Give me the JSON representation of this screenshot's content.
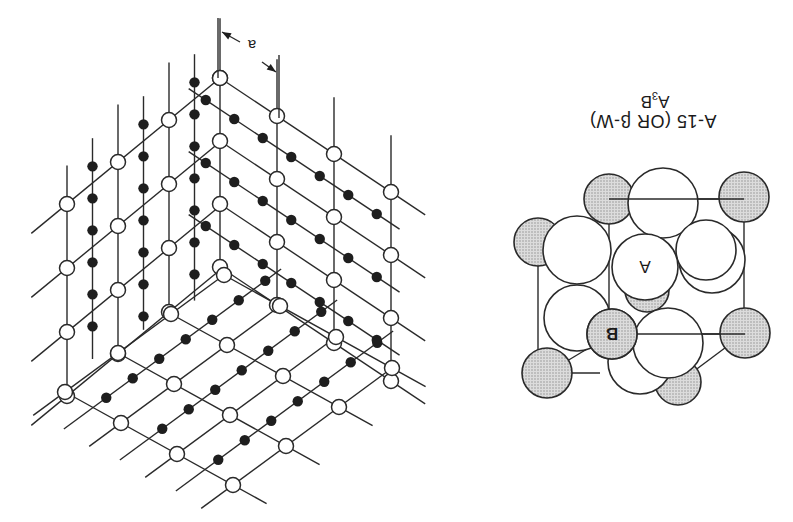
{
  "figure": {
    "orientation": "rotated-180",
    "background": "#ffffff",
    "line_color": "#2a2a2a",
    "dot_color": "#1e1e1e",
    "shade_color": "#c8c8c8"
  },
  "lattice": {
    "name": "A15 lattice perspective",
    "scale_label": "a",
    "scale_bar": {
      "line1": [
        218,
        18,
        218,
        78
      ],
      "line2": [
        279,
        55,
        279,
        118
      ],
      "label_pos": [
        252,
        50
      ],
      "arrow1": [
        [
          240,
          42
        ],
        [
          222,
          32
        ]
      ],
      "arrow2": [
        [
          262,
          62
        ],
        [
          276,
          72
        ]
      ]
    },
    "top_corner": [
      220,
      78
    ],
    "left_face": {
      "origin": [
        220,
        78
      ],
      "u": [
        -51,
        42
      ],
      "v": [
        0,
        64
      ],
      "nu": 3,
      "nv": 3
    },
    "right_face": {
      "origin": [
        220,
        78
      ],
      "u": [
        57,
        38
      ],
      "v": [
        0,
        63
      ],
      "nu": 3,
      "nv": 3
    },
    "bottom_face": {
      "origin": [
        224,
        275
      ],
      "u": [
        56,
        31
      ],
      "v": [
        -53,
        39
      ],
      "nu": 3,
      "nv": 3
    },
    "legend": {
      "white_node": "B atom site",
      "black_node": "A atom chain"
    }
  },
  "sphere_model": {
    "spheres": [
      {
        "type": "B",
        "cx": 678,
        "cy": 382,
        "r": 23
      },
      {
        "type": "A",
        "cx": 640,
        "cy": 362,
        "r": 32
      },
      {
        "type": "B",
        "cx": 547,
        "cy": 373,
        "r": 25
      },
      {
        "type": "B",
        "cx": 538,
        "cy": 242,
        "r": 24
      },
      {
        "type": "B",
        "cx": 609,
        "cy": 199,
        "r": 25
      },
      {
        "type": "A",
        "cx": 663,
        "cy": 203,
        "r": 35
      },
      {
        "type": "B",
        "cx": 744,
        "cy": 197,
        "r": 25
      },
      {
        "type": "A",
        "cx": 712,
        "cy": 260,
        "r": 33
      },
      {
        "type": "A",
        "cx": 706,
        "cy": 250,
        "r": 30
      },
      {
        "type": "B",
        "cx": 647,
        "cy": 290,
        "r": 22
      },
      {
        "type": "A",
        "cx": 577,
        "cy": 250,
        "r": 34
      },
      {
        "type": "A",
        "cx": 577,
        "cy": 318,
        "r": 33
      },
      {
        "type": "A",
        "cx": 645,
        "cy": 267,
        "r": 33,
        "label": "A"
      },
      {
        "type": "A",
        "cx": 668,
        "cy": 343,
        "r": 35
      },
      {
        "type": "B",
        "cx": 745,
        "cy": 333,
        "r": 25
      },
      {
        "type": "B",
        "cx": 612,
        "cy": 334,
        "r": 25,
        "label": "B"
      }
    ],
    "cube_edges": [
      [
        547,
        373,
        600,
        373
      ],
      [
        612,
        334,
        745,
        334
      ],
      [
        609,
        199,
        744,
        199
      ],
      [
        538,
        242,
        538,
        373
      ],
      [
        609,
        199,
        609,
        334
      ],
      [
        744,
        197,
        744,
        333
      ],
      [
        678,
        383,
        745,
        333
      ],
      [
        547,
        373,
        612,
        334
      ]
    ]
  },
  "caption": {
    "title": "A-15 (OR β-W)",
    "formula_main": "A",
    "formula_sub": "3",
    "formula_tail": "B"
  }
}
